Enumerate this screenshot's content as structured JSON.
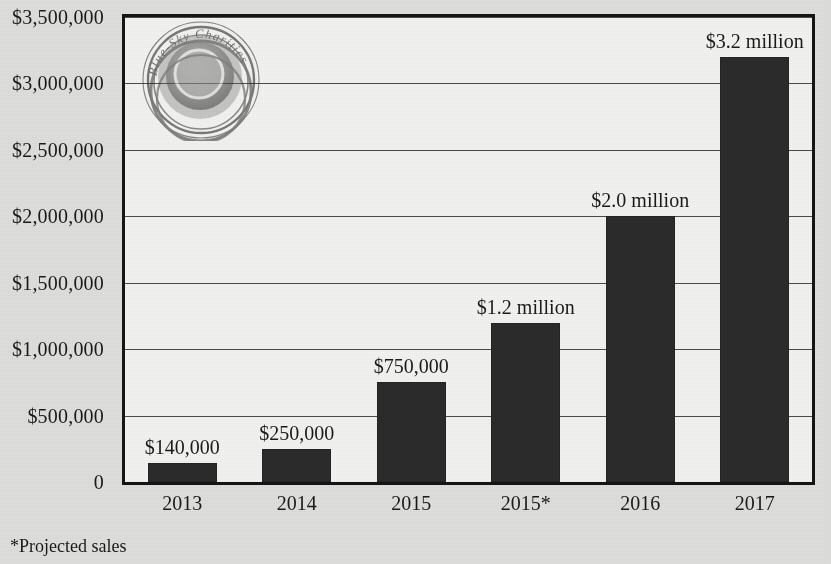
{
  "chart_data": {
    "type": "bar",
    "title": "",
    "subtitle": "",
    "xlabel": "",
    "ylabel": "",
    "categories": [
      "2013",
      "2014",
      "2015",
      "2015*",
      "2016",
      "2017"
    ],
    "values": [
      140000,
      250000,
      750000,
      1200000,
      2000000,
      3200000
    ],
    "data_labels": [
      "$140,000",
      "$250,000",
      "$750,000",
      "$1.2 million",
      "$2.0 million",
      "$3.2 million"
    ],
    "ylim": [
      0,
      3500000
    ],
    "y_ticks": [
      0,
      500000,
      1000000,
      1500000,
      2000000,
      2500000,
      3000000,
      3500000
    ],
    "y_tick_labels": [
      "0",
      "$500,000",
      "$1,000,000",
      "$1,500,000",
      "$2,000,000",
      "$2,500,000",
      "$3,000,000",
      "$3,500,000"
    ],
    "grid": true,
    "legend": null,
    "annotations": [
      "*Projected sales"
    ],
    "bar_color": "#2b2b2b",
    "plot_background": "#f2f2f0",
    "figure_background": "#dededc"
  },
  "footnote": "*Projected sales",
  "watermark": {
    "name": "blue-sky-charities-logo",
    "text": "Blue-Sky Charities"
  }
}
